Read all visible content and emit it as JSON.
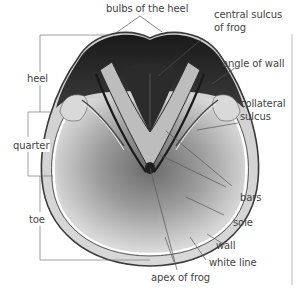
{
  "diagram": {
    "labels": {
      "bulbs_of_the_heel": "bulbs of the heel",
      "central_sulcus_line1": "central sulcus",
      "central_sulcus_line2": "of frog",
      "angle_of_wall": "angle of wall",
      "collateral_sulcus_line1": "collateral",
      "collateral_sulcus_line2": "sulcus",
      "bars": "bars",
      "sole": "sole",
      "wall": "wall",
      "white_line": "white line",
      "apex_of_frog": "apex of frog",
      "heel": "heel",
      "quarter": "quarter",
      "toe": "toe"
    },
    "colors": {
      "leader_line": "#555555",
      "bracket_line": "#777777",
      "text": "#444444",
      "hoof_dark": "#1e1e1e",
      "hoof_light": "#e8e8e8"
    }
  }
}
